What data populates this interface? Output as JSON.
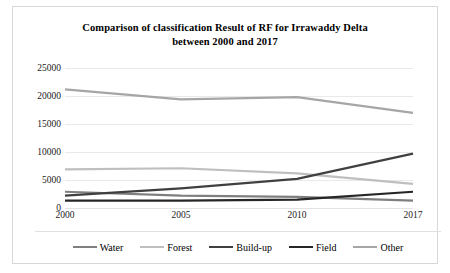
{
  "chart_data": {
    "type": "line",
    "title": "Comparison of classification Result of RF for Irrawaddy Delta between 2000 and 2017",
    "title_line1": "Comparison of classification Result of RF for Irrawaddy Delta",
    "title_line2": "between 2000 and 2017",
    "xlabel": "",
    "ylabel": "",
    "categories": [
      "2000",
      "2005",
      "2010",
      "2017"
    ],
    "x": [
      2000,
      2005,
      2010,
      2017
    ],
    "ylim": [
      0,
      25000
    ],
    "yticks": [
      "0",
      "5000",
      "10000",
      "15000",
      "20000",
      "25000"
    ],
    "ytick_values": [
      0,
      5000,
      10000,
      15000,
      20000,
      25000
    ],
    "grid": true,
    "legend_position": "bottom",
    "series": [
      {
        "name": "Water",
        "color": "#7f7f7f",
        "values": [
          2900,
          2200,
          2000,
          1300
        ]
      },
      {
        "name": "Forest",
        "color": "#bfbfbf",
        "values": [
          6900,
          7100,
          6200,
          4300
        ]
      },
      {
        "name": "Build-up",
        "color": "#404040",
        "values": [
          2200,
          3500,
          5200,
          9700
        ]
      },
      {
        "name": "Field",
        "color": "#262626",
        "values": [
          1300,
          1300,
          1500,
          2900
        ]
      },
      {
        "name": "Other",
        "color": "#a6a6a6",
        "values": [
          21200,
          19400,
          19800,
          17000
        ]
      }
    ]
  }
}
